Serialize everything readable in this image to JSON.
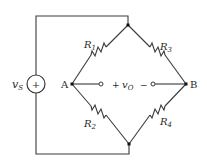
{
  "diagram": {
    "type": "Wheatstone bridge circuit",
    "source": {
      "label_main": "v",
      "label_sub": "S",
      "polarity": "+"
    },
    "nodes": {
      "left": "A",
      "right": "B"
    },
    "resistors": [
      {
        "main": "R",
        "sub": "1",
        "position": "upper-left"
      },
      {
        "main": "R",
        "sub": "2",
        "position": "lower-left"
      },
      {
        "main": "R",
        "sub": "3",
        "position": "upper-right"
      },
      {
        "main": "R",
        "sub": "4",
        "position": "lower-right"
      }
    ],
    "output": {
      "plus": "+",
      "label_main": "v",
      "label_sub": "O",
      "minus": "−"
    },
    "colors": {
      "line": "#3a3a3a",
      "text": "#2a2a2a",
      "background": "#ffffff"
    }
  }
}
